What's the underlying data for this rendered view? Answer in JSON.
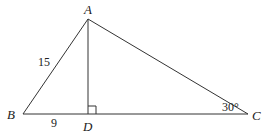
{
  "diagram": {
    "type": "triangle",
    "vertices": {
      "A": {
        "label": "A",
        "x": 88,
        "y": 19
      },
      "B": {
        "label": "B",
        "x": 23,
        "y": 114
      },
      "C": {
        "label": "C",
        "x": 248,
        "y": 114
      },
      "D": {
        "label": "D",
        "x": 88,
        "y": 114
      }
    },
    "segments": [
      "AB",
      "AC",
      "BC",
      "AD"
    ],
    "measurements": {
      "AB": "15",
      "BD": "9",
      "angle_C": "30°"
    },
    "right_angle_at": "D",
    "stroke_color": "#333333"
  }
}
